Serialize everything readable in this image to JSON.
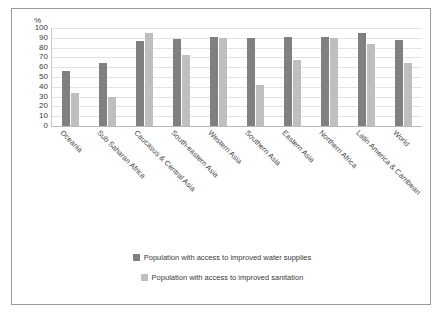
{
  "chart_data": {
    "type": "bar",
    "title": "",
    "xlabel": "",
    "ylabel": "%",
    "ylim": [
      0,
      100
    ],
    "yticks": [
      100,
      90,
      80,
      70,
      60,
      50,
      40,
      30,
      20,
      10,
      0
    ],
    "grid": true,
    "legend_position": "bottom",
    "categories": [
      "Oceania",
      "Sub Saharan Africa",
      "Caucasus & Central Asia",
      "South-eastern Asia",
      "Western Asia",
      "Southern Asia",
      "Eastern Asia",
      "Northern Africa",
      "Latin America & Carribean",
      "World"
    ],
    "series": [
      {
        "name": "Population with access to improved water supplies",
        "color": "#808080",
        "values": [
          56,
          64,
          87,
          89,
          91,
          90,
          91,
          91,
          95,
          88
        ]
      },
      {
        "name": "Population with access to improved sanitation",
        "color": "#bfbfbf",
        "values": [
          34,
          30,
          95,
          72,
          90,
          42,
          67,
          90,
          84,
          64
        ]
      }
    ]
  },
  "legend": {
    "items": [
      {
        "label": "Population with access to improved water supplies",
        "color": "#808080"
      },
      {
        "label": "Population with access to improved sanitation",
        "color": "#bfbfbf"
      }
    ]
  }
}
